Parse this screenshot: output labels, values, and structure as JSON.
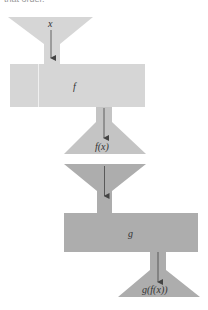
{
  "caption": "that order.",
  "diagram": {
    "machines": [
      {
        "name": "f",
        "input_label": "x",
        "output_label": "f(x)",
        "color": "#d6d6d6",
        "output_color": "#c4c4c4"
      },
      {
        "name": "g",
        "input_label": "",
        "output_label": "g(f(x))",
        "color": "#adadad",
        "output_color": "#adadad"
      }
    ],
    "colors": {
      "light": "#d6d6d6",
      "medium": "#c4c4c4",
      "dark": "#adadad",
      "arrow": "#444444"
    }
  }
}
